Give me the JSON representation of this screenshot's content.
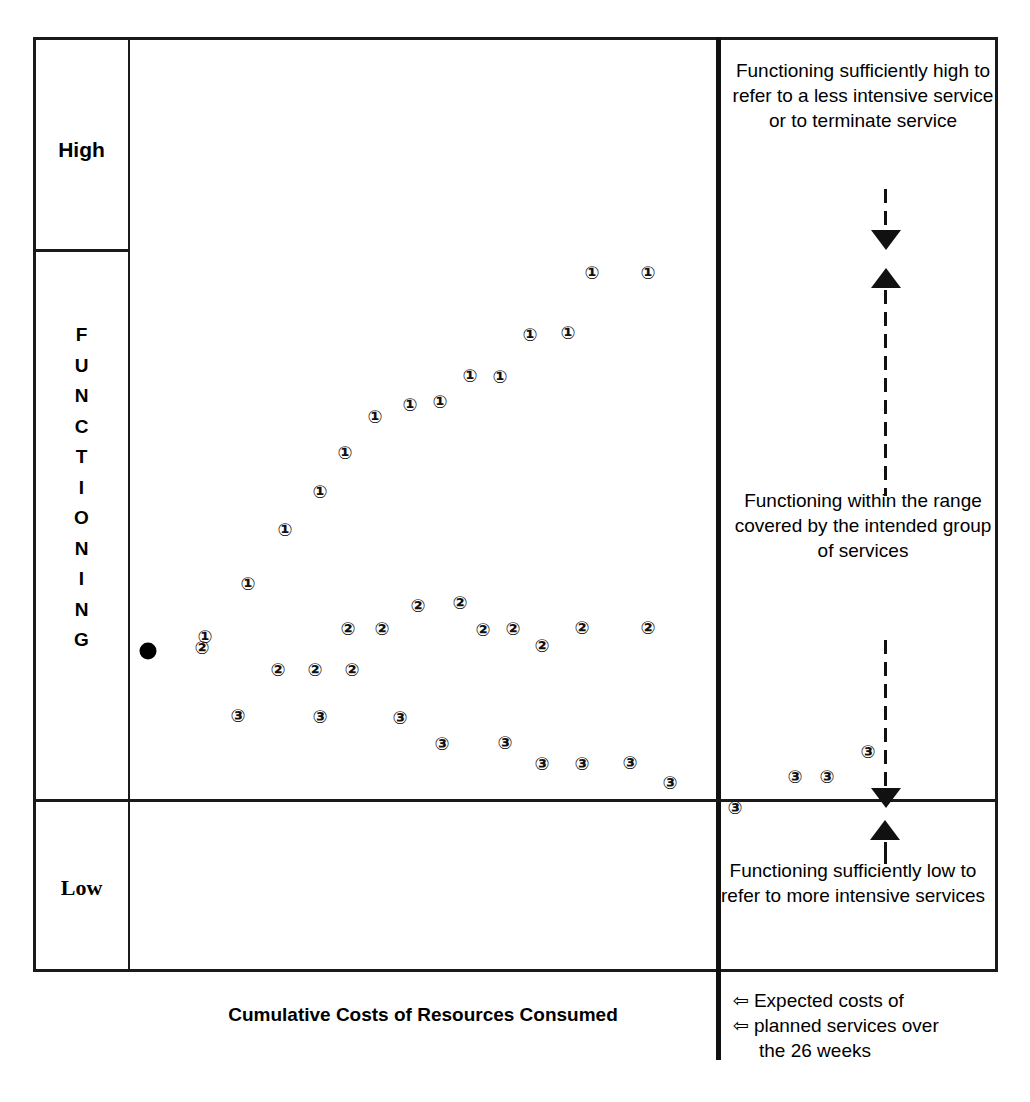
{
  "chart_data": {
    "type": "scatter",
    "title": "",
    "xlabel": "Cumulative Costs of Resources Consumed",
    "ylabel": "FUNCTIONING",
    "grid": false,
    "legend_position": "none",
    "y_band_labels": [
      "High",
      "FUNCTIONING",
      "Low"
    ],
    "y_band_boundaries_note": "High band above upper divider; Low band below lower divider",
    "series": [
      {
        "name": "1",
        "marker": "circled-number-1",
        "points": [
          {
            "x": 75,
            "y": 597
          },
          {
            "x": 118,
            "y": 544
          },
          {
            "x": 155,
            "y": 490
          },
          {
            "x": 190,
            "y": 452
          },
          {
            "x": 215,
            "y": 413
          },
          {
            "x": 245,
            "y": 377
          },
          {
            "x": 280,
            "y": 365
          },
          {
            "x": 310,
            "y": 362
          },
          {
            "x": 340,
            "y": 336
          },
          {
            "x": 370,
            "y": 337
          },
          {
            "x": 400,
            "y": 295
          },
          {
            "x": 438,
            "y": 293
          },
          {
            "x": 462,
            "y": 233
          },
          {
            "x": 518,
            "y": 233
          }
        ]
      },
      {
        "name": "2",
        "marker": "circled-number-2",
        "points": [
          {
            "x": 72,
            "y": 608
          },
          {
            "x": 148,
            "y": 630
          },
          {
            "x": 185,
            "y": 630
          },
          {
            "x": 222,
            "y": 630
          },
          {
            "x": 218,
            "y": 589
          },
          {
            "x": 252,
            "y": 589
          },
          {
            "x": 288,
            "y": 566
          },
          {
            "x": 330,
            "y": 563
          },
          {
            "x": 353,
            "y": 590
          },
          {
            "x": 383,
            "y": 589
          },
          {
            "x": 412,
            "y": 606
          },
          {
            "x": 452,
            "y": 588
          },
          {
            "x": 518,
            "y": 588
          }
        ]
      },
      {
        "name": "3",
        "marker": "circled-number-3",
        "points": [
          {
            "x": 108,
            "y": 676
          },
          {
            "x": 190,
            "y": 677
          },
          {
            "x": 270,
            "y": 678
          },
          {
            "x": 312,
            "y": 704
          },
          {
            "x": 375,
            "y": 703
          },
          {
            "x": 412,
            "y": 724
          },
          {
            "x": 452,
            "y": 724
          },
          {
            "x": 500,
            "y": 723
          },
          {
            "x": 540,
            "y": 743
          },
          {
            "x": 605,
            "y": 768
          },
          {
            "x": 665,
            "y": 737
          },
          {
            "x": 697,
            "y": 737
          },
          {
            "x": 738,
            "y": 712
          }
        ]
      },
      {
        "name": "start",
        "marker": "filled-dot",
        "points": [
          {
            "x": 18,
            "y": 611
          }
        ]
      }
    ]
  },
  "axis": {
    "high_label": "High",
    "low_label": "Low",
    "functioning_letters": [
      "F",
      "U",
      "N",
      "C",
      "T",
      "I",
      "O",
      "N",
      "I",
      "N",
      "G"
    ],
    "x_title": "Cumulative Costs of Resources Consumed"
  },
  "annotations": {
    "top": "Functioning sufficiently high to refer to a less intensive service or to terminate service",
    "middle": "Functioning within the range covered by the intended group of services",
    "bottom": "Functioning sufficiently low to refer to more intensive services"
  },
  "legend": {
    "arrow_glyph": "⇦",
    "line1": "Expected costs of",
    "line2": "planned services over",
    "line3": "the 26 weeks"
  },
  "colors": {
    "ink": "#111111",
    "background": "#ffffff"
  }
}
